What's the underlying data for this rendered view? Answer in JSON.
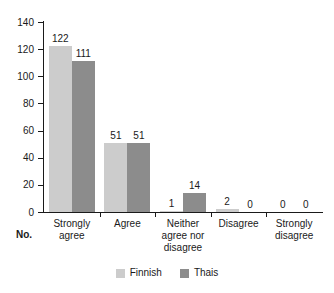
{
  "chart_data": {
    "type": "bar",
    "title": "",
    "xlabel": "No.",
    "ylabel": "",
    "categories": [
      "Strongly agree",
      "Agree",
      "Neither agree nor disagree",
      "Disagree",
      "Strongly disagree"
    ],
    "category_lines": [
      [
        "Strongly",
        "agree"
      ],
      [
        "Agree"
      ],
      [
        "Neither",
        "agree nor",
        "disagree"
      ],
      [
        "Disagree"
      ],
      [
        "Strongly",
        "disagree"
      ]
    ],
    "series": [
      {
        "name": "Finnish",
        "color": "#cccccc",
        "values": [
          122,
          51,
          1,
          2,
          0
        ]
      },
      {
        "name": "Thais",
        "color": "#8c8c8c",
        "values": [
          111,
          51,
          14,
          0,
          0
        ]
      }
    ],
    "ylim": [
      0,
      140
    ],
    "yticks": [
      0,
      20,
      40,
      60,
      80,
      100,
      120,
      140
    ],
    "ytick_labels": [
      "0",
      "20",
      "40",
      "60",
      "80",
      "100",
      "120",
      "140"
    ],
    "grid": false,
    "legend_position": "bottom",
    "data_labels": {
      "strongly_agree": [
        "122",
        "111"
      ],
      "agree": [
        "51",
        "51"
      ],
      "neither": [
        "1",
        "14"
      ],
      "disagree": [
        "2",
        "0"
      ],
      "strongly_disagree": [
        "0",
        "0"
      ]
    }
  },
  "legend": {
    "items": [
      {
        "label": "Finnish",
        "color": "#cccccc"
      },
      {
        "label": "Thais",
        "color": "#8c8c8c"
      }
    ]
  },
  "axis": {
    "no_label": "No."
  }
}
